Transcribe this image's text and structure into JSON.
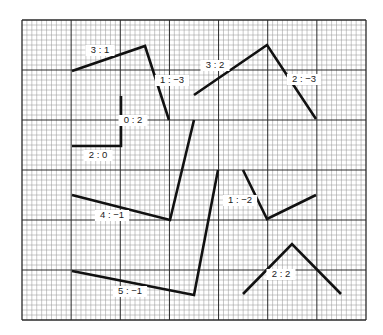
{
  "grid": {
    "x0": 22,
    "y0": 20,
    "x1": 366,
    "y1": 320,
    "major_cols": 7,
    "major_rows": 6,
    "minor_per_major": 10,
    "minor_color": "#9a9a9a",
    "major_color": "#2a2a2a",
    "border_color": "#333333"
  },
  "figures": [
    {
      "id": "fig-1",
      "points": [
        [
          72,
          71
        ],
        [
          145,
          46
        ],
        [
          169,
          120
        ]
      ],
      "labels": [
        {
          "text": "3 : 1",
          "x": 100,
          "y": 53
        },
        {
          "text": "1 : −3",
          "x": 172,
          "y": 83
        }
      ]
    },
    {
      "id": "fig-2",
      "points": [
        [
          121,
          96
        ],
        [
          121,
          146
        ],
        [
          72,
          146
        ]
      ],
      "labels": [
        {
          "text": "0 : 2",
          "x": 133,
          "y": 123
        },
        {
          "text": "2 : 0",
          "x": 98,
          "y": 158
        }
      ]
    },
    {
      "id": "fig-3",
      "points": [
        [
          194,
          95
        ],
        [
          267,
          45
        ],
        [
          316,
          119
        ]
      ],
      "labels": [
        {
          "text": "3 : 2",
          "x": 215,
          "y": 68
        },
        {
          "text": "2 : −3",
          "x": 304,
          "y": 82
        }
      ]
    },
    {
      "id": "fig-4",
      "points": [
        [
          72,
          195
        ],
        [
          170,
          220
        ],
        [
          194,
          120
        ]
      ],
      "labels": [
        {
          "text": "4 : −1",
          "x": 112,
          "y": 218
        }
      ]
    },
    {
      "id": "fig-5",
      "points": [
        [
          72,
          271
        ],
        [
          194,
          295
        ],
        [
          218,
          170
        ]
      ],
      "labels": [
        {
          "text": "5 : −1",
          "x": 130,
          "y": 294
        }
      ]
    },
    {
      "id": "fig-6",
      "points": [
        [
          243,
          170
        ],
        [
          267,
          219
        ],
        [
          316,
          195
        ]
      ],
      "labels": [
        {
          "text": "1 : −2",
          "x": 240,
          "y": 203
        }
      ]
    },
    {
      "id": "fig-7",
      "points": [
        [
          243,
          294
        ],
        [
          292,
          244
        ],
        [
          341,
          294
        ]
      ],
      "labels": [
        {
          "text": "2 : 2",
          "x": 281,
          "y": 277
        }
      ]
    }
  ],
  "line_color": "#111111"
}
